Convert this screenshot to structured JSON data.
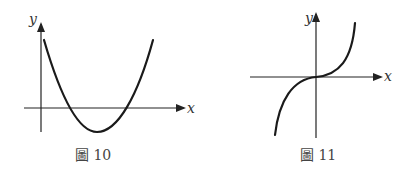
{
  "figures": [
    {
      "id": "fig10",
      "caption": "圖 10",
      "x_label": "x",
      "y_label": "y",
      "curve_type": "parabola (opens upward, two positive x-intercepts, vertex below x-axis)"
    },
    {
      "id": "fig11",
      "caption": "圖 11",
      "x_label": "x",
      "y_label": "y",
      "curve_type": "cubic (increasing, inflection at origin)"
    }
  ],
  "colors": {
    "curve": "#1a1a1a",
    "axis": "#222222",
    "text": "#444444",
    "background": "#ffffff"
  }
}
